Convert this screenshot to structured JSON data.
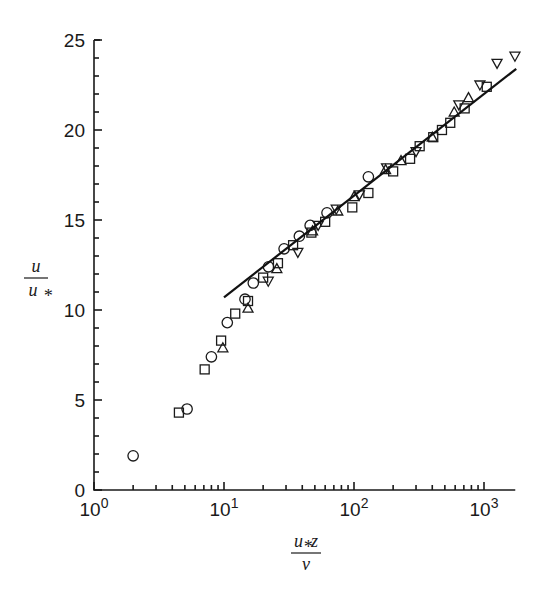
{
  "chart_data": {
    "type": "scatter",
    "title": "",
    "xlabel": "u*z / ν",
    "ylabel": "u / u*",
    "xlabel_parts": {
      "numerator": "u",
      "numerator_sub": "*",
      "numerator_rest": "z",
      "denominator": "ν"
    },
    "ylabel_parts": {
      "numerator": "u",
      "denominator": "u",
      "denominator_sub": "*"
    },
    "xscale": "log",
    "xlim": [
      1,
      1740
    ],
    "ylim": [
      0,
      25
    ],
    "grid": false,
    "legend": null,
    "x_ticks": [
      {
        "value": 1,
        "base": "10",
        "exp": "0"
      },
      {
        "value": 10,
        "base": "10",
        "exp": "1"
      },
      {
        "value": 100,
        "base": "10",
        "exp": "2"
      },
      {
        "value": 1000,
        "base": "10",
        "exp": "3"
      }
    ],
    "y_ticks": [
      0,
      5,
      10,
      15,
      20,
      25
    ],
    "y_minor_step": 1,
    "series": [
      {
        "name": "circles",
        "marker": "circle",
        "points": [
          [
            2.0,
            1.9
          ],
          [
            5.2,
            4.5
          ],
          [
            8.0,
            7.4
          ],
          [
            10.6,
            9.3
          ],
          [
            14.5,
            10.6
          ],
          [
            16.8,
            11.5
          ],
          [
            22,
            12.4
          ],
          [
            29,
            13.4
          ],
          [
            38,
            14.1
          ],
          [
            46,
            14.7
          ],
          [
            62,
            15.4
          ],
          [
            129,
            17.4
          ]
        ]
      },
      {
        "name": "squares",
        "marker": "square",
        "points": [
          [
            4.5,
            4.3
          ],
          [
            7.1,
            6.7
          ],
          [
            9.5,
            8.3
          ],
          [
            12.2,
            9.8
          ],
          [
            15.3,
            10.5
          ],
          [
            20,
            11.8
          ],
          [
            26,
            12.6
          ],
          [
            34,
            13.6
          ],
          [
            47,
            14.3
          ],
          [
            60,
            14.9
          ],
          [
            97,
            15.7
          ],
          [
            129,
            16.5
          ],
          [
            200,
            17.7
          ],
          [
            270,
            18.4
          ],
          [
            320,
            19.1
          ],
          [
            407,
            19.6
          ],
          [
            475,
            20.0
          ],
          [
            550,
            20.4
          ],
          [
            710,
            21.2
          ],
          [
            1050,
            22.4
          ]
        ]
      },
      {
        "name": "triangles",
        "marker": "triangle-up",
        "points": [
          [
            9.8,
            7.9
          ],
          [
            15.3,
            10.1
          ],
          [
            25.5,
            12.3
          ],
          [
            48,
            14.4
          ],
          [
            75,
            15.5
          ],
          [
            100,
            16.3
          ],
          [
            175,
            17.8
          ],
          [
            230,
            18.3
          ],
          [
            400,
            19.6
          ],
          [
            590,
            21.0
          ],
          [
            760,
            21.8
          ]
        ]
      },
      {
        "name": "inverted-triangles",
        "marker": "triangle-down",
        "points": [
          [
            21.9,
            11.6
          ],
          [
            37,
            13.2
          ],
          [
            53,
            14.7
          ],
          [
            73,
            15.6
          ],
          [
            110,
            16.4
          ],
          [
            178,
            17.9
          ],
          [
            300,
            18.8
          ],
          [
            640,
            21.4
          ],
          [
            930,
            22.5
          ],
          [
            1260,
            23.7
          ],
          [
            1730,
            24.1
          ]
        ]
      }
    ],
    "fit_line": {
      "name": "log-law",
      "x": [
        10,
        1770
      ],
      "y": [
        10.7,
        23.4
      ]
    }
  }
}
